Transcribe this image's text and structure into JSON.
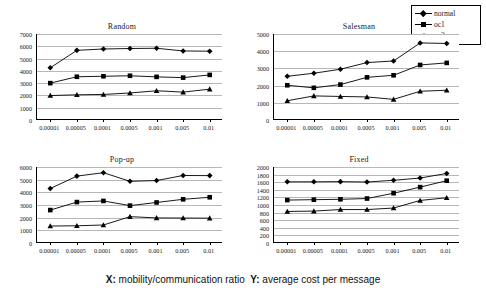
{
  "caption": {
    "x_prefix": "X:",
    "x_text": "mobility/communication ratio",
    "y_prefix": "Y:",
    "y_text": "average cost per message",
    "full": "X: mobility/communication ratio  Y: average cost per message"
  },
  "legend": {
    "position": "top-right",
    "items": [
      {
        "label": "normal",
        "marker": "diamond",
        "color": "#000000"
      },
      {
        "label": "oc1",
        "marker": "square",
        "color": "#000000"
      },
      {
        "label": "oc2",
        "marker": "triangle",
        "color": "#000000"
      }
    ]
  },
  "chart_data": [
    {
      "type": "line",
      "title": "Random",
      "xlabel": "",
      "ylabel": "",
      "grid": true,
      "legend_position": "shared-top-right",
      "categories": [
        "0.00001",
        "0.00005",
        "0.0001",
        "0.0005",
        "0.001",
        "0.005",
        "0.01"
      ],
      "ylim": [
        0,
        7000
      ],
      "yticks": [
        0,
        1000,
        2000,
        3000,
        4000,
        5000,
        6000,
        7000
      ],
      "series": [
        {
          "name": "normal",
          "marker": "diamond",
          "values": [
            4250,
            5670,
            5780,
            5820,
            5840,
            5620,
            5600
          ]
        },
        {
          "name": "oc1",
          "marker": "square",
          "values": [
            3000,
            3520,
            3560,
            3600,
            3510,
            3450,
            3670
          ]
        },
        {
          "name": "oc2",
          "marker": "triangle",
          "values": [
            1990,
            2050,
            2080,
            2200,
            2380,
            2270,
            2510
          ]
        }
      ]
    },
    {
      "type": "line",
      "title": "Salesman",
      "xlabel": "",
      "ylabel": "",
      "grid": true,
      "legend_position": "shared-top-right",
      "categories": [
        "0.00001",
        "0.00005",
        "0.0001",
        "0.0005",
        "0.001",
        "0.005",
        "0.01"
      ],
      "ylim": [
        0,
        5000
      ],
      "yticks": [
        0,
        1000,
        2000,
        3000,
        4000,
        5000
      ],
      "series": [
        {
          "name": "normal",
          "marker": "diamond",
          "values": [
            2540,
            2720,
            2950,
            3340,
            3430,
            4480,
            4450
          ]
        },
        {
          "name": "oc1",
          "marker": "square",
          "values": [
            2020,
            1870,
            2060,
            2480,
            2600,
            3200,
            3320
          ]
        },
        {
          "name": "oc2",
          "marker": "triangle",
          "values": [
            1120,
            1400,
            1370,
            1340,
            1200,
            1670,
            1730
          ]
        }
      ]
    },
    {
      "type": "line",
      "title": "Pop-up",
      "xlabel": "",
      "ylabel": "",
      "grid": true,
      "legend_position": "shared-top-right",
      "categories": [
        "0.00001",
        "0.00005",
        "0.0001",
        "0.0005",
        "0.001",
        "0.005",
        "0.01"
      ],
      "ylim": [
        0,
        6000
      ],
      "yticks": [
        0,
        1000,
        2000,
        3000,
        4000,
        5000,
        6000
      ],
      "series": [
        {
          "name": "normal",
          "marker": "diamond",
          "values": [
            4300,
            5280,
            5550,
            4870,
            4930,
            5330,
            5320
          ]
        },
        {
          "name": "oc1",
          "marker": "square",
          "values": [
            2600,
            3230,
            3320,
            2950,
            3200,
            3450,
            3610
          ]
        },
        {
          "name": "oc2",
          "marker": "triangle",
          "values": [
            1340,
            1360,
            1420,
            2080,
            1980,
            1970,
            1960
          ]
        }
      ]
    },
    {
      "type": "line",
      "title": "Fixed",
      "xlabel": "",
      "ylabel": "",
      "grid": true,
      "legend_position": "shared-top-right",
      "categories": [
        "0.00001",
        "0.00005",
        "0.0001",
        "0.0005",
        "0.001",
        "0.005",
        "0.01"
      ],
      "ylim": [
        0,
        2000
      ],
      "yticks": [
        0,
        200,
        400,
        600,
        800,
        1000,
        1200,
        1400,
        1600,
        1800,
        2000
      ],
      "series": [
        {
          "name": "normal",
          "marker": "diamond",
          "values": [
            1610,
            1610,
            1615,
            1605,
            1650,
            1710,
            1830
          ]
        },
        {
          "name": "oc1",
          "marker": "square",
          "values": [
            1130,
            1140,
            1150,
            1170,
            1310,
            1470,
            1640
          ]
        },
        {
          "name": "oc2",
          "marker": "triangle",
          "values": [
            830,
            840,
            880,
            880,
            920,
            1120,
            1190
          ]
        }
      ]
    }
  ]
}
